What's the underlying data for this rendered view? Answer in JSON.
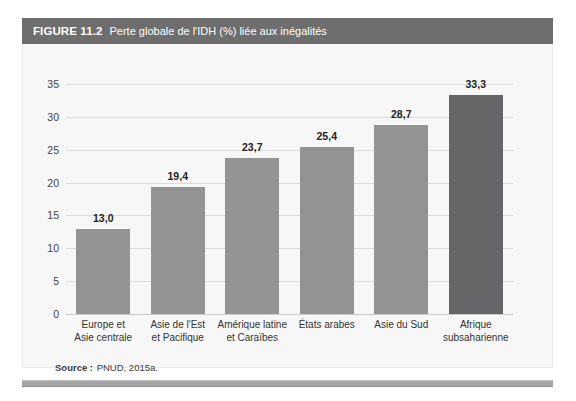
{
  "figure": {
    "number": "FIGURE 11.2",
    "caption": "Perte globale de l'IDH (%) liée aux inégalités",
    "source_label": "Source :",
    "source_text": "PNUD, 2015a."
  },
  "colors": {
    "title_bar": "#6e6e6e",
    "panel_background": "#f7f7f7",
    "bar": "#949494",
    "bar_highlight": "#666668",
    "gridline": "#dcdcdc",
    "axis": "#c9c9c9",
    "bottom_rule": "#a6a6a8",
    "text": "#232323"
  },
  "chart_data": {
    "type": "bar",
    "title": "Perte globale de l'IDH (%) liée aux inégalités",
    "xlabel": "",
    "ylabel": "",
    "ylim": [
      0,
      35
    ],
    "yticks": [
      0,
      5,
      10,
      15,
      20,
      25,
      30,
      35
    ],
    "ytick_labels": [
      "0",
      "5",
      "10",
      "15",
      "20",
      "25",
      "30",
      "35"
    ],
    "grid": true,
    "legend": false,
    "categories": [
      "Europe et Asie centrale",
      "Asie de l'Est et Pacifique",
      "Amérique latine et Caraïbes",
      "États arabes",
      "Asie du Sud",
      "Afrique subsaharienne"
    ],
    "category_lines": [
      [
        "Europe et",
        "Asie centrale"
      ],
      [
        "Asie de l'Est",
        "et Pacifique"
      ],
      [
        "Amérique latine",
        "et Caraïbes"
      ],
      [
        "États arabes",
        ""
      ],
      [
        "Asie du Sud",
        ""
      ],
      [
        "Afrique",
        "subsaharienne"
      ]
    ],
    "values": [
      13.0,
      19.4,
      23.7,
      25.4,
      28.7,
      33.3
    ],
    "value_labels": [
      "13,0",
      "19,4",
      "23,7",
      "25,4",
      "28,7",
      "33,3"
    ],
    "bar_colors": [
      "#949494",
      "#949494",
      "#949494",
      "#949494",
      "#949494",
      "#666668"
    ],
    "highlight_index": 5,
    "source": "PNUD, 2015a."
  }
}
